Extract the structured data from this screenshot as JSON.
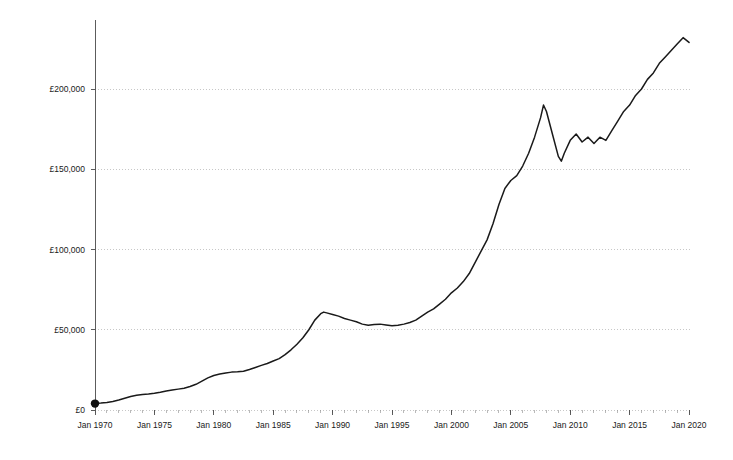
{
  "chart_data": {
    "type": "line",
    "title": "",
    "subtitle": "",
    "xlabel": "",
    "ylabel": "",
    "grid": true,
    "legend": false,
    "currency_symbol": "£",
    "xlim": [
      1970,
      2020.25
    ],
    "ylim": [
      0,
      232000
    ],
    "y_ticks": [
      0,
      50000,
      100000,
      150000,
      200000
    ],
    "y_tick_labels": [
      "£0",
      "£50,000",
      "£100,000",
      "£150,000",
      "£200,000"
    ],
    "x_ticks": [
      1970,
      1975,
      1980,
      1985,
      1990,
      1995,
      2000,
      2005,
      2010,
      2015,
      2020
    ],
    "x_tick_labels": [
      "Jan 1970",
      "Jan 1975",
      "Jan 1980",
      "Jan 1985",
      "Jan 1990",
      "Jan 1995",
      "Jan 2000",
      "Jan 2005",
      "Jan 2010",
      "Jan 2015",
      "Jan 2020"
    ],
    "start_marker": {
      "x": 1970,
      "y": 4000,
      "shape": "circle"
    },
    "line_color": "#1a1a1a",
    "grid_color": "#b9b9b9",
    "axis_color": "#4a4a4a",
    "series": [
      {
        "name": "Average house price",
        "x": [
          1970,
          1970.5,
          1971,
          1971.5,
          1972,
          1972.5,
          1973,
          1973.5,
          1974,
          1974.5,
          1975,
          1975.5,
          1976,
          1976.5,
          1977,
          1977.5,
          1978,
          1978.5,
          1979,
          1979.5,
          1980,
          1980.5,
          1981,
          1981.5,
          1982,
          1982.5,
          1983,
          1983.5,
          1984,
          1984.5,
          1985,
          1985.5,
          1986,
          1986.5,
          1987,
          1987.5,
          1988,
          1988.5,
          1989,
          1989.25,
          1989.5,
          1990,
          1990.5,
          1991,
          1991.5,
          1992,
          1992.5,
          1993,
          1993.5,
          1994,
          1994.5,
          1995,
          1995.5,
          1996,
          1996.5,
          1997,
          1997.5,
          1998,
          1998.5,
          1999,
          1999.5,
          2000,
          2000.5,
          2001,
          2001.5,
          2002,
          2002.5,
          2003,
          2003.5,
          2004,
          2004.5,
          2005,
          2005.5,
          2006,
          2006.5,
          2007,
          2007.5,
          2007.75,
          2008,
          2008.5,
          2009,
          2009.25,
          2009.5,
          2010,
          2010.5,
          2011,
          2011.5,
          2012,
          2012.5,
          2013,
          2013.5,
          2014,
          2014.5,
          2015,
          2015.5,
          2016,
          2016.5,
          2017,
          2017.5,
          2018,
          2018.5,
          2019,
          2019.5,
          2020
        ],
        "y": [
          4000,
          4300,
          4700,
          5300,
          6200,
          7300,
          8400,
          9200,
          9700,
          10000,
          10400,
          11000,
          11800,
          12400,
          13000,
          13600,
          14600,
          16000,
          18000,
          20000,
          21500,
          22400,
          23100,
          23600,
          23800,
          24100,
          25200,
          26500,
          27800,
          29000,
          30500,
          32000,
          34500,
          37500,
          41000,
          45000,
          50000,
          56000,
          60000,
          61000,
          60500,
          59500,
          58500,
          57000,
          56000,
          55000,
          53500,
          52800,
          53200,
          53500,
          53000,
          52500,
          52800,
          53500,
          54500,
          56000,
          58500,
          61000,
          63000,
          66000,
          69000,
          73000,
          76000,
          80000,
          85000,
          92000,
          99000,
          106000,
          116000,
          128000,
          138000,
          143000,
          146000,
          152000,
          160000,
          170000,
          182000,
          190000,
          186000,
          172000,
          158000,
          155000,
          160000,
          168000,
          172000,
          167000,
          170000,
          166000,
          170000,
          168000,
          174000,
          180000,
          186000,
          190000,
          196000,
          200000,
          206000,
          210000,
          216000,
          220000,
          224000,
          228000,
          232000,
          229000
        ]
      }
    ],
    "annotations": [
      {
        "label": "late-1980s peak",
        "x": 1989.25,
        "y": 61000
      },
      {
        "label": "mid-1990s trough",
        "x": 1995,
        "y": 52500
      },
      {
        "label": "pre-crisis peak",
        "x": 2007.5,
        "y": 190000
      },
      {
        "label": "2009 trough",
        "x": 2009.25,
        "y": 155000
      }
    ]
  },
  "plot_geometry": {
    "left": 95,
    "right": 692,
    "top": 20,
    "bottom": 410
  }
}
